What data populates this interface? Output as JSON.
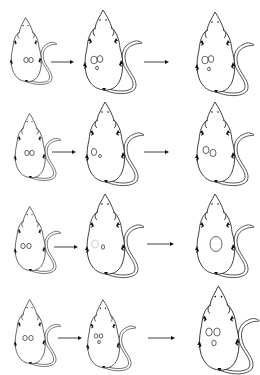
{
  "figure": {
    "type": "tumor-growth-progression-diagram",
    "background": "#ffffff",
    "stroke_color": "#111111",
    "rows": [
      {
        "stages": [
          {
            "size": "small",
            "x": 4,
            "y": 16,
            "scale": 0.8,
            "tumors": [
              {
                "cx": 26,
                "cy": 60,
                "rx": 2.2,
                "ry": 2.6
              },
              {
                "cx": 31,
                "cy": 60,
                "rx": 2.2,
                "ry": 2.6
              }
            ]
          },
          {
            "size": "medium",
            "x": 76,
            "y": 8,
            "scale": 1.0,
            "tumors": [
              {
                "cx": 94,
                "cy": 60,
                "rx": 3.2,
                "ry": 3.8
              },
              {
                "cx": 100,
                "cy": 59,
                "rx": 2.8,
                "ry": 3.4
              },
              {
                "cx": 97,
                "cy": 68,
                "rx": 1.4,
                "ry": 1.8
              }
            ]
          },
          {
            "size": "large",
            "x": 188,
            "y": 10,
            "scale": 1.0,
            "tumors": [
              {
                "cx": 205,
                "cy": 60,
                "rx": 3.2,
                "ry": 3.8
              },
              {
                "cx": 211,
                "cy": 59,
                "rx": 2.8,
                "ry": 3.4
              },
              {
                "cx": 209,
                "cy": 69,
                "rx": 1.4,
                "ry": 1.8
              }
            ]
          }
        ],
        "arrows": [
          {
            "x1": 51,
            "x2": 72,
            "y": 62
          },
          {
            "x1": 144,
            "x2": 167,
            "y": 62
          }
        ]
      },
      {
        "stages": [
          {
            "size": "small",
            "x": 8,
            "y": 112,
            "scale": 0.8,
            "tumors": [
              {
                "cx": 27,
                "cy": 153,
                "rx": 2.2,
                "ry": 2.6
              },
              {
                "cx": 32,
                "cy": 153,
                "rx": 2.2,
                "ry": 2.6
              }
            ]
          },
          {
            "size": "medium",
            "x": 78,
            "y": 100,
            "scale": 1.0,
            "tumors": [
              {
                "cx": 94,
                "cy": 152,
                "rx": 2.6,
                "ry": 3.6
              },
              {
                "cx": 100,
                "cy": 156,
                "rx": 1.4,
                "ry": 1.6
              }
            ]
          },
          {
            "size": "large",
            "x": 188,
            "y": 100,
            "scale": 1.0,
            "tumors": [
              {
                "cx": 206,
                "cy": 150,
                "rx": 3.0,
                "ry": 3.6
              },
              {
                "cx": 213,
                "cy": 153,
                "rx": 3.0,
                "ry": 3.6
              }
            ]
          }
        ],
        "arrows": [
          {
            "x1": 52,
            "x2": 74,
            "y": 152
          },
          {
            "x1": 144,
            "x2": 167,
            "y": 152
          }
        ]
      },
      {
        "stages": [
          {
            "size": "small",
            "x": 8,
            "y": 205,
            "scale": 0.8,
            "tumors": [
              {
                "cx": 23,
                "cy": 246,
                "rx": 2.2,
                "ry": 2.6
              },
              {
                "cx": 29,
                "cy": 246,
                "rx": 2.2,
                "ry": 2.6
              }
            ]
          },
          {
            "size": "medium",
            "x": 78,
            "y": 192,
            "scale": 1.0,
            "tumors": [
              {
                "cx": 95,
                "cy": 244,
                "rx": 3.5,
                "ry": 4.0,
                "faint": true
              },
              {
                "cx": 103,
                "cy": 247,
                "rx": 1.6,
                "ry": 2.2
              }
            ]
          },
          {
            "size": "large",
            "x": 188,
            "y": 192,
            "scale": 1.0,
            "tumors": [
              {
                "cx": 216,
                "cy": 244,
                "rx": 6.0,
                "ry": 7.5
              }
            ]
          }
        ],
        "arrows": [
          {
            "x1": 54,
            "x2": 76,
            "y": 247
          },
          {
            "x1": 147,
            "x2": 172,
            "y": 244
          }
        ]
      },
      {
        "stages": [
          {
            "size": "small",
            "x": 8,
            "y": 298,
            "scale": 0.8,
            "tumors": [
              {
                "cx": 25,
                "cy": 338,
                "rx": 2.2,
                "ry": 2.6
              },
              {
                "cx": 31,
                "cy": 338,
                "rx": 2.2,
                "ry": 2.6
              }
            ]
          },
          {
            "size": "medium-small",
            "x": 80,
            "y": 298,
            "scale": 0.85,
            "tumors": [
              {
                "cx": 96,
                "cy": 336,
                "rx": 1.8,
                "ry": 2.2
              },
              {
                "cx": 101,
                "cy": 336,
                "rx": 1.8,
                "ry": 2.2
              },
              {
                "cx": 99,
                "cy": 342,
                "rx": 1.4,
                "ry": 1.6
              }
            ]
          },
          {
            "size": "large",
            "x": 190,
            "y": 284,
            "scale": 1.05,
            "tumors": [
              {
                "cx": 209,
                "cy": 332,
                "rx": 3.2,
                "ry": 4.0
              },
              {
                "cx": 217,
                "cy": 332,
                "rx": 3.2,
                "ry": 4.0
              },
              {
                "cx": 214,
                "cy": 343,
                "rx": 2.2,
                "ry": 2.8
              }
            ]
          }
        ],
        "arrows": [
          {
            "x1": 58,
            "x2": 80,
            "y": 338
          },
          {
            "x1": 148,
            "x2": 173,
            "y": 338
          }
        ]
      }
    ]
  }
}
